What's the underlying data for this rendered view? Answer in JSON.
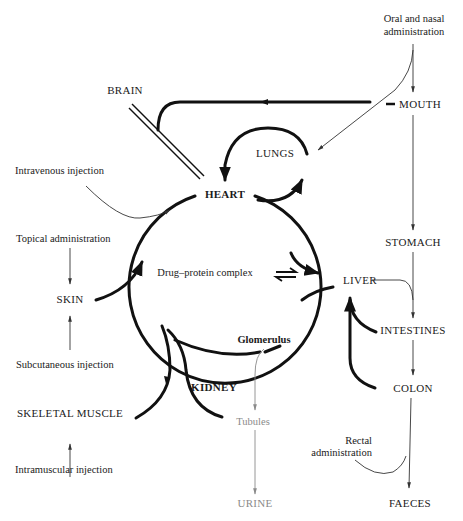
{
  "diagram": {
    "center": {
      "heart": "HEART",
      "drug_protein_complex": "Drug–protein complex",
      "equilibrium_symbol": "⇌"
    },
    "organs": {
      "brain": "BRAIN",
      "lungs": "LUNGS",
      "liver": "LIVER",
      "kidney": "KIDNEY",
      "glomerulus": "Glomerulus",
      "tubules": "Tubules",
      "urine": "URINE",
      "skin": "SKIN",
      "skeletal_muscle": "SKELETAL MUSCLE",
      "mouth": "MOUTH",
      "stomach": "STOMACH",
      "intestines": "INTESTINES",
      "colon": "COLON",
      "faeces": "FAECES"
    },
    "routes": {
      "oral_nasal_line1": "Oral and nasal",
      "oral_nasal_line2": "administration",
      "intravenous": "Intravenous injection",
      "topical": "Topical administration",
      "subcutaneous": "Subcutaneous injection",
      "intramuscular": "Intramuscular injection",
      "rectal_line1": "Rectal",
      "rectal_line2": "administration"
    },
    "colors": {
      "line": "#111111",
      "grey_text": "#8a8a8a"
    }
  }
}
